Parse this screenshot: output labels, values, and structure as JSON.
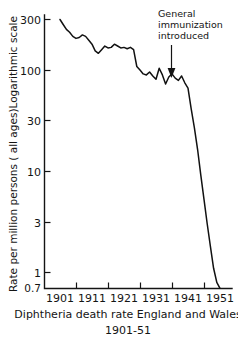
{
  "chart_data": {
    "type": "line",
    "title": "",
    "caption_line1": "Diphtheria death rate England and Wales",
    "caption_line2": "1901-51",
    "xlabel": "",
    "ylabel": "Rate per million persons ( all ages)Logarithmic scale",
    "yscale": "log",
    "ylim": [
      0.7,
      380
    ],
    "xlim": [
      1899.5,
      1952.5
    ],
    "ytick_labels": [
      "300",
      "100",
      "30",
      "10",
      "3",
      "1",
      "0.7"
    ],
    "ytick_values": [
      300,
      100,
      30,
      10,
      3,
      1,
      0.7
    ],
    "xtick_labels": [
      "1901",
      "1911",
      "1921",
      "1931",
      "1941",
      "1951"
    ],
    "xtick_values": [
      1901,
      1911,
      1921,
      1931,
      1941,
      1951
    ],
    "xminor_tick_values": [
      1906,
      1916,
      1926,
      1936,
      1946
    ],
    "grid": false,
    "legend": null,
    "line_color": "#111111",
    "series": [
      {
        "name": "Diphtheria death rate",
        "x": [
          1901,
          1902,
          1903,
          1904,
          1905,
          1906,
          1907,
          1908,
          1909,
          1910,
          1911,
          1912,
          1913,
          1914,
          1915,
          1916,
          1917,
          1918,
          1919,
          1920,
          1921,
          1922,
          1923,
          1924,
          1925,
          1926,
          1927,
          1928,
          1929,
          1930,
          1931,
          1932,
          1933,
          1934,
          1935,
          1936,
          1937,
          1938,
          1939,
          1940,
          1941,
          1942,
          1943,
          1944,
          1945,
          1946,
          1947,
          1948,
          1949,
          1950,
          1951
        ],
        "values": [
          300,
          268,
          240,
          225,
          205,
          196,
          200,
          212,
          205,
          188,
          172,
          148,
          140,
          152,
          165,
          158,
          160,
          172,
          165,
          158,
          160,
          155,
          160,
          152,
          104,
          96,
          88,
          86,
          92,
          84,
          78,
          100,
          86,
          70,
          82,
          88,
          80,
          76,
          84,
          72,
          64,
          40,
          26,
          16,
          9,
          5.2,
          3.0,
          1.8,
          1.1,
          0.8,
          0.7
        ]
      }
    ],
    "annotations": [
      {
        "name": "general-immunization-introduced",
        "text_line1": "General",
        "text_line2": "immunization",
        "text_line3": "introduced",
        "arrow": "down",
        "points_at_year": 1940
      }
    ]
  }
}
